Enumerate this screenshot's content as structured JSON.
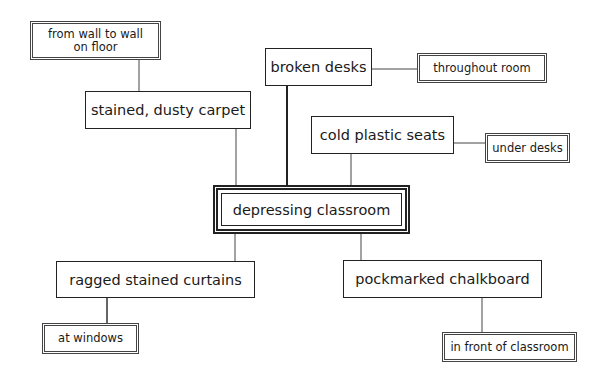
{
  "diagram": {
    "type": "cluster map",
    "center": {
      "label": "depressing classroom"
    },
    "nodes": [
      {
        "id": "carpet",
        "label": "stained, dusty carpet",
        "detail": {
          "id": "carpet_detail",
          "label": "from wall to wall on floor",
          "line1": "from wall to wall",
          "line2": "on floor"
        }
      },
      {
        "id": "desks",
        "label": "broken desks",
        "detail": {
          "id": "desks_detail",
          "label": "throughout room"
        }
      },
      {
        "id": "seats",
        "label": "cold plastic seats",
        "detail": {
          "id": "seats_detail",
          "label": "under desks"
        }
      },
      {
        "id": "curtains",
        "label": "ragged stained curtains",
        "detail": {
          "id": "curtains_detail",
          "label": "at windows"
        }
      },
      {
        "id": "chalkboard",
        "label": "pockmarked chalkboard",
        "detail": {
          "id": "chalkboard_detail",
          "label": "in front of classroom"
        }
      }
    ]
  }
}
